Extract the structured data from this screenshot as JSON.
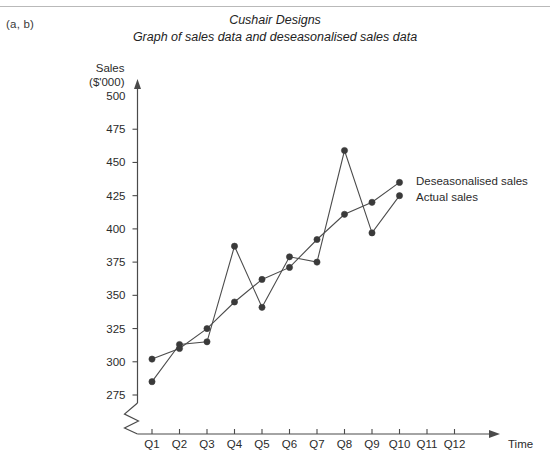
{
  "page": {
    "part_label": "(a, b)"
  },
  "chart_data": {
    "type": "line",
    "title": "Cushair Designs",
    "subtitle": "Graph of sales data and deseasonalised sales data",
    "xlabel": "Time",
    "ylabel_line1": "Sales",
    "ylabel_line2": "($'000)",
    "categories": [
      "Q1",
      "Q2",
      "Q3",
      "Q4",
      "Q5",
      "Q6",
      "Q7",
      "Q8",
      "Q9",
      "Q10",
      "Q11",
      "Q12"
    ],
    "ylim": [
      262,
      500
    ],
    "yticks": [
      275,
      300,
      325,
      350,
      375,
      400,
      425,
      450,
      475,
      500
    ],
    "grid": false,
    "axis_break": true,
    "legend_position": "right",
    "series": [
      {
        "name": "Actual sales",
        "values": [
          285,
          313,
          315,
          387,
          341,
          379,
          375,
          459,
          397,
          425,
          null,
          null
        ]
      },
      {
        "name": "Deseasonalised sales",
        "values": [
          302,
          310,
          325,
          345,
          362,
          371,
          392,
          411,
          420,
          435,
          null,
          null
        ]
      }
    ],
    "legend": [
      {
        "label": "Deseasonalised sales"
      },
      {
        "label": "Actual sales"
      }
    ],
    "colors": {
      "axis": "#4a4a4a",
      "line": "#4c4c4c",
      "marker": "#3a3a3a",
      "text": "#2b2b2b"
    }
  }
}
